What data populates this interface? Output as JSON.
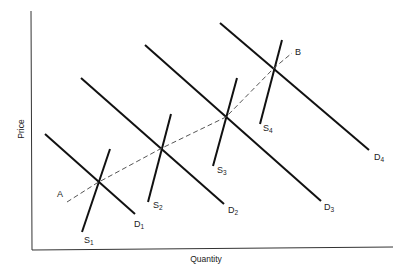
{
  "diagram": {
    "title": "",
    "axes": {
      "x_label": "Quantity",
      "y_label": "Price"
    },
    "path": {
      "start_label": "A",
      "end_label": "B",
      "style": "dashed"
    },
    "demand_curves": [
      {
        "name": "D",
        "sub": "1"
      },
      {
        "name": "D",
        "sub": "2"
      },
      {
        "name": "D",
        "sub": "3"
      },
      {
        "name": "D",
        "sub": "4"
      }
    ],
    "supply_curves": [
      {
        "name": "S",
        "sub": "1"
      },
      {
        "name": "S",
        "sub": "2"
      },
      {
        "name": "S",
        "sub": "3"
      },
      {
        "name": "S",
        "sub": "4"
      }
    ],
    "colors": {
      "line": "#111111",
      "axis": "#333333",
      "dashed": "#555555"
    }
  }
}
